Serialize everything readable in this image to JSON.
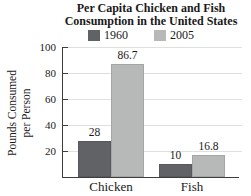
{
  "title": {
    "line1": "Per Capita Chicken and Fish",
    "line2": "Consumption in the United States"
  },
  "legend": [
    {
      "label": "1960",
      "color": "#606265"
    },
    {
      "label": "2005",
      "color": "#b6b9b7"
    }
  ],
  "axis": {
    "ylabel_line1": "Pounds Consumed",
    "ylabel_line2": "per Person",
    "ticks": [
      20,
      40,
      60,
      80,
      100
    ]
  },
  "colors": {
    "axis": "#3d3d3d",
    "grid": "#e0e0e0"
  },
  "chart_data": {
    "type": "bar",
    "title": "Per Capita Chicken and Fish Consumption in the United States",
    "categories": [
      "Chicken",
      "Fish"
    ],
    "series": [
      {
        "name": "1960",
        "values": [
          28,
          10
        ],
        "color": "#606265"
      },
      {
        "name": "2005",
        "values": [
          86.7,
          16.8
        ],
        "color": "#b6b9b7"
      }
    ],
    "xlabel": "",
    "ylabel": "Pounds Consumed per Person",
    "ylim": [
      0,
      100
    ],
    "yticks": [
      20,
      40,
      60,
      80,
      100
    ],
    "grid": true,
    "legend_position": "top",
    "data_labels": true
  }
}
